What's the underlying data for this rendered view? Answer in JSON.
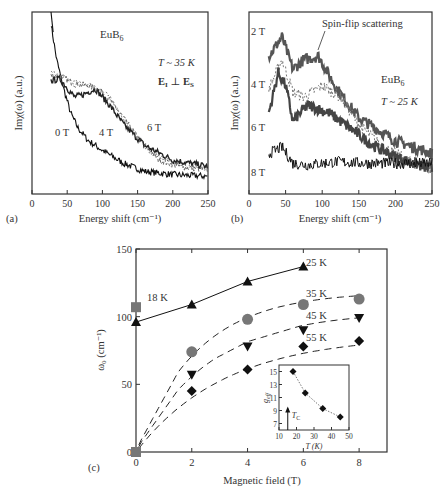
{
  "chart_data": [
    {
      "panel": "(a)",
      "type": "line",
      "title": "EuB6",
      "annotations": [
        "T ~ 35 K",
        "E_I ⊥ E_S"
      ],
      "xlabel": "Energy shift (cm⁻¹)",
      "ylabel": "Imχ(ω) (a.u.)",
      "xlim": [
        0,
        250
      ],
      "xticks": [
        0,
        50,
        100,
        150,
        200,
        250
      ],
      "series": [
        {
          "name": "0 T",
          "x": [
            27,
            35,
            45,
            55,
            65,
            80,
            100,
            130,
            160,
            200,
            250
          ],
          "y": [
            1.0,
            0.78,
            0.6,
            0.45,
            0.36,
            0.28,
            0.22,
            0.14,
            0.09,
            0.07,
            0.06
          ]
        },
        {
          "name": "4 T",
          "x": [
            27,
            40,
            60,
            80,
            100,
            120,
            150,
            180,
            210,
            250
          ],
          "y": [
            0.68,
            0.68,
            0.63,
            0.62,
            0.58,
            0.48,
            0.3,
            0.16,
            0.12,
            0.1
          ]
        },
        {
          "name": "6 T",
          "x": [
            27,
            40,
            60,
            70,
            90,
            110,
            130,
            160,
            200,
            250
          ],
          "y": [
            0.65,
            0.66,
            0.55,
            0.56,
            0.6,
            0.5,
            0.38,
            0.25,
            0.16,
            0.12
          ]
        }
      ]
    },
    {
      "panel": "(b)",
      "type": "line",
      "title": "EuB6",
      "annotations": [
        "T ~ 25 K",
        "Spin-flip scattering"
      ],
      "xlabel": "Energy shift (cm⁻¹)",
      "ylabel": "Imχ(ω) (a.u.)",
      "xlim": [
        0,
        250
      ],
      "xticks": [
        0,
        50,
        100,
        150,
        200,
        250
      ],
      "series": [
        {
          "name": "2 T",
          "x": [
            27,
            45,
            60,
            75,
            95,
            120,
            150,
            200,
            250
          ],
          "y": [
            0.8,
            0.92,
            0.72,
            0.78,
            0.8,
            0.6,
            0.42,
            0.28,
            0.2
          ]
        },
        {
          "name": "4 T",
          "x": [
            27,
            45,
            60,
            75,
            100,
            125,
            150,
            180,
            220,
            250
          ],
          "y": [
            0.6,
            0.78,
            0.58,
            0.55,
            0.62,
            0.55,
            0.38,
            0.25,
            0.15,
            0.1
          ]
        },
        {
          "name": "6 T",
          "x": [
            27,
            40,
            50,
            60,
            80,
            110,
            140,
            170,
            200,
            250
          ],
          "y": [
            0.45,
            0.7,
            0.62,
            0.4,
            0.5,
            0.45,
            0.35,
            0.25,
            0.18,
            0.1
          ]
        },
        {
          "name": "8 T",
          "x": [
            27,
            45,
            60,
            80,
            120,
            160,
            200,
            250
          ],
          "y": [
            0.2,
            0.24,
            0.14,
            0.13,
            0.15,
            0.14,
            0.14,
            0.14
          ]
        }
      ]
    },
    {
      "panel": "(c)",
      "type": "scatter",
      "xlabel": "Magnetic field (T)",
      "ylabel": "ω₀ (cm⁻¹)",
      "xlim": [
        0,
        9
      ],
      "ylim": [
        0,
        150
      ],
      "xticks": [
        0,
        2,
        4,
        6,
        8
      ],
      "yticks": [
        0,
        50,
        100,
        150
      ],
      "series": [
        {
          "name": "18 K",
          "marker": "square",
          "color": "#777777",
          "x": [
            0
          ],
          "y": [
            107
          ]
        },
        {
          "name": "25 K",
          "marker": "triangle-up",
          "color": "#111111",
          "line": "solid",
          "x": [
            0,
            2,
            4,
            6
          ],
          "y": [
            96,
            109,
            126,
            137
          ]
        },
        {
          "name": "35 K",
          "marker": "circle",
          "color": "#777777",
          "line": "dashed",
          "x": [
            2,
            4,
            6,
            8
          ],
          "y": [
            74,
            98,
            109,
            113
          ]
        },
        {
          "name": "45 K",
          "marker": "triangle-down",
          "color": "#111111",
          "line": "dashed",
          "x": [
            2,
            4,
            6,
            8
          ],
          "y": [
            57,
            78,
            90,
            99
          ]
        },
        {
          "name": "55 K",
          "marker": "diamond",
          "color": "#111111",
          "line": "dashed",
          "x": [
            2,
            4,
            6,
            8
          ],
          "y": [
            45,
            61,
            78,
            82
          ]
        },
        {
          "name": "origin",
          "marker": "square",
          "color": "#777777",
          "x": [
            0
          ],
          "y": [
            0
          ]
        }
      ],
      "inset": {
        "type": "scatter",
        "xlabel": "T (K)",
        "ylabel": "g_eff",
        "xlim": [
          10,
          50
        ],
        "ylim": [
          6,
          16
        ],
        "xticks": [
          10,
          20,
          30,
          40,
          50
        ],
        "yticks": [
          7,
          9,
          11,
          13,
          15
        ],
        "annotation": "T_C",
        "tc": 15,
        "series": [
          {
            "name": "g_eff",
            "marker": "diamond",
            "line": "dotted",
            "x": [
              18,
              25,
              35,
              45
            ],
            "y": [
              15,
              11.7,
              9.3,
              8
            ]
          }
        ]
      }
    }
  ],
  "labels": {
    "a_panel": "(a)",
    "b_panel": "(b)",
    "c_panel": "(c)",
    "a_title": "EuB",
    "a_sub": "6",
    "a_temp": "T ~ 35 K",
    "a_pol": "E",
    "a_0t": "0 T",
    "a_4t": "4 T",
    "a_6t": "6 T",
    "b_title": "EuB",
    "b_sub": "6",
    "b_temp": "T ~ 25 K",
    "b_spinflip": "Spin-flip scattering",
    "b_2t": "2 T",
    "b_4t": "4 T",
    "b_6t": "6 T",
    "b_8t": "8 T",
    "xlabel_ab": "Energy shift (cm⁻¹)",
    "ylabel_ab": "Imχ(ω) (a.u.)",
    "c_xlabel": "Magnetic field (T)",
    "c_ylabel": "ω₀ (cm⁻¹)",
    "c_18k": "18 K",
    "c_25k": "25 K",
    "c_35k": "35 K",
    "c_45k": "45 K",
    "c_55k": "55 K",
    "inset_xlabel": "T (K)",
    "inset_ylabel": "g_eff",
    "inset_tc": "T_C"
  }
}
